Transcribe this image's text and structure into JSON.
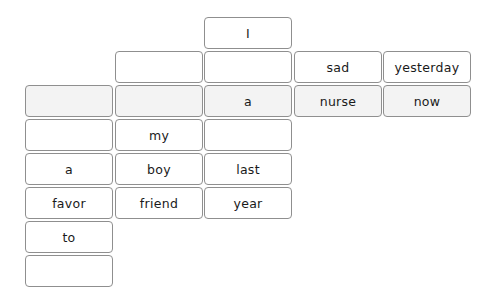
{
  "grid": {
    "col_x": [
      25,
      115,
      204,
      294,
      383
    ],
    "row_y": [
      17,
      51,
      85,
      119,
      153,
      187,
      221,
      255
    ],
    "shaded_row": 2,
    "colors": {
      "border": "#8f8f8f",
      "cell_bg": "#ffffff",
      "shaded_bg": "#f3f3f3",
      "text": "#1a1a1a"
    },
    "cells": [
      {
        "row": 0,
        "col": 2,
        "text": "I"
      },
      {
        "row": 1,
        "col": 1,
        "text": ""
      },
      {
        "row": 1,
        "col": 2,
        "text": ""
      },
      {
        "row": 1,
        "col": 3,
        "text": "sad"
      },
      {
        "row": 1,
        "col": 4,
        "text": "yesterday"
      },
      {
        "row": 2,
        "col": 0,
        "text": ""
      },
      {
        "row": 2,
        "col": 1,
        "text": ""
      },
      {
        "row": 2,
        "col": 2,
        "text": "a"
      },
      {
        "row": 2,
        "col": 3,
        "text": "nurse"
      },
      {
        "row": 2,
        "col": 4,
        "text": "now"
      },
      {
        "row": 3,
        "col": 0,
        "text": ""
      },
      {
        "row": 3,
        "col": 1,
        "text": "my"
      },
      {
        "row": 3,
        "col": 2,
        "text": ""
      },
      {
        "row": 4,
        "col": 0,
        "text": "a"
      },
      {
        "row": 4,
        "col": 1,
        "text": "boy"
      },
      {
        "row": 4,
        "col": 2,
        "text": "last"
      },
      {
        "row": 5,
        "col": 0,
        "text": "favor"
      },
      {
        "row": 5,
        "col": 1,
        "text": "friend"
      },
      {
        "row": 5,
        "col": 2,
        "text": "year"
      },
      {
        "row": 6,
        "col": 0,
        "text": "to"
      },
      {
        "row": 7,
        "col": 0,
        "text": ""
      }
    ]
  }
}
